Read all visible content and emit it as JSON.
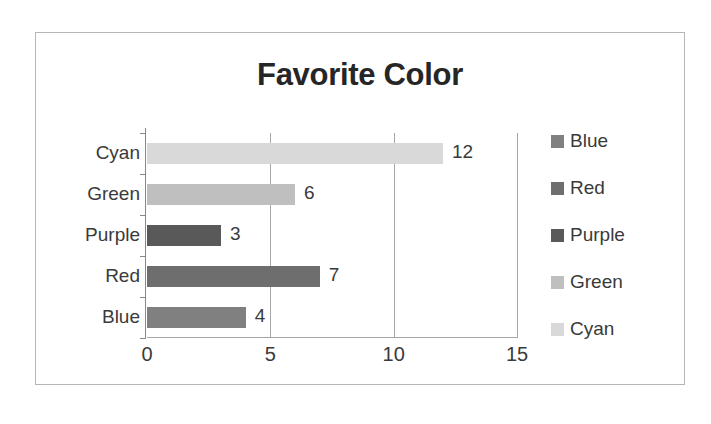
{
  "chart_data": {
    "type": "bar",
    "orientation": "horizontal",
    "title": "Favorite Color",
    "xlabel": "",
    "ylabel": "",
    "categories": [
      "Blue",
      "Red",
      "Purple",
      "Green",
      "Cyan"
    ],
    "values": [
      4,
      7,
      3,
      6,
      12
    ],
    "data_labels": [
      "4",
      "7",
      "3",
      "6",
      "12"
    ],
    "category_order_top_to_bottom": [
      "Cyan",
      "Green",
      "Purple",
      "Red",
      "Blue"
    ],
    "xlim": [
      0,
      15
    ],
    "xticks": [
      0,
      5,
      10,
      15
    ],
    "xtick_labels": [
      "0",
      "5",
      "10",
      "15"
    ],
    "grid": "vertical",
    "legend_position": "right",
    "legend": [
      {
        "label": "Blue",
        "color": "#808080"
      },
      {
        "label": "Red",
        "color": "#6e6e6e"
      },
      {
        "label": "Purple",
        "color": "#595959"
      },
      {
        "label": "Green",
        "color": "#bfbfbf"
      },
      {
        "label": "Cyan",
        "color": "#d9d9d9"
      }
    ],
    "series_colors": {
      "Blue": "#808080",
      "Red": "#6e6e6e",
      "Purple": "#595959",
      "Green": "#bfbfbf",
      "Cyan": "#d9d9d9"
    },
    "axis_color": "#a6a6a6",
    "text_color": "#3a3a3a",
    "border_color": "#b6b6b6",
    "background": "#ffffff"
  }
}
